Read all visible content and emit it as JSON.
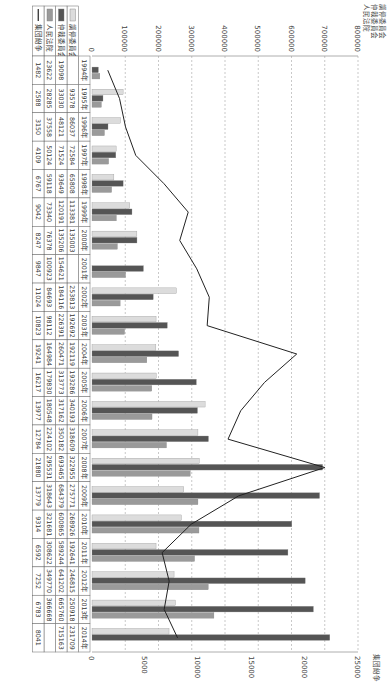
{
  "chart_data": {
    "type": "bar",
    "title": "",
    "left_axis_label": [
      "調停委員会",
      "仲裁委員会",
      "人民法院"
    ],
    "right_axis_label": "集団紛争",
    "xlabel": "",
    "ylabel": "調停委員会 仲裁委員会 人民法院",
    "y2label": "集団紛争",
    "ylim": [
      0,
      800000
    ],
    "y_ticks": [
      0,
      100000,
      200000,
      300000,
      400000,
      500000,
      600000,
      700000,
      800000
    ],
    "y2lim": [
      0,
      25000
    ],
    "y2_ticks": [
      0,
      5000,
      10000,
      15000,
      20000,
      25000
    ],
    "grid": true,
    "legend_position": "bottom-table",
    "categories": [
      "1994年",
      "1995年",
      "1996年",
      "1997年",
      "1998年",
      "1999年",
      "2000年",
      "2001年",
      "2002年",
      "2003年",
      "2004年",
      "2005年",
      "2006年",
      "2007年",
      "2008年",
      "2009年",
      "2010年",
      "2011年",
      "2012年",
      "2013年",
      "2014年"
    ],
    "series": [
      {
        "name": "調停委員会",
        "kind": "bar",
        "axis": "left",
        "color": "#dcdcdc",
        "values": [
          null,
          93578,
          86037,
          72584,
          65808,
          113381,
          135003,
          null,
          253813,
          192692,
          192119,
          193286,
          340193,
          318609,
          322955,
          275771,
          268926,
          192641,
          246815,
          250918,
          231709
        ]
      },
      {
        "name": "仲裁委員会",
        "kind": "bar",
        "axis": "left",
        "color": "#555555",
        "values": [
          19098,
          33030,
          48121,
          71524,
          93649,
          120191,
          135206,
          154621,
          184116,
          226391,
          260471,
          313773,
          317162,
          350182,
          693465,
          684379,
          600865,
          589244,
          641202,
          665760,
          715163
        ]
      },
      {
        "name": "人民法院",
        "kind": "bar",
        "axis": "left",
        "color": "#9a9a9a",
        "values": [
          23622,
          28285,
          37558,
          50124,
          59118,
          73340,
          76378,
          100923,
          84693,
          98112,
          164984,
          179830,
          180548,
          224102,
          295531,
          318643,
          321681,
          308622,
          349770,
          366668,
          null
        ]
      },
      {
        "name": "集団紛争",
        "kind": "line",
        "axis": "right",
        "color": "#222222",
        "values": [
          1482,
          2588,
          3150,
          4109,
          6767,
          9042,
          8247,
          9847,
          11024,
          10823,
          19241,
          16217,
          13977,
          12784,
          21880,
          13779,
          9314,
          6592,
          7252,
          6783,
          8041
        ]
      }
    ]
  },
  "axes": {
    "left_title_lines": [
      "調停委員会",
      "仲裁委員会",
      "人民法院"
    ],
    "right_title": "集団紛争"
  }
}
